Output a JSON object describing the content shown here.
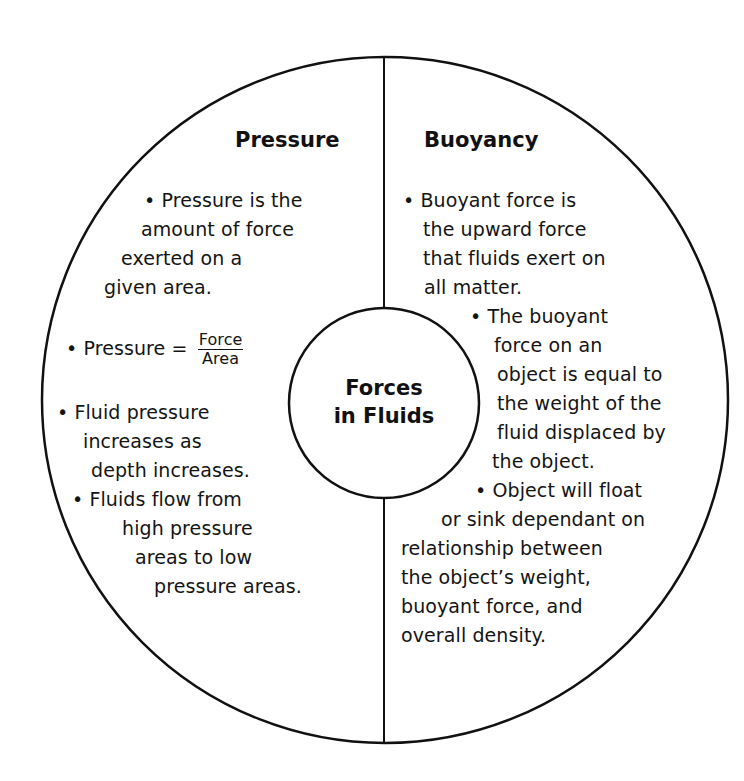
{
  "diagram": {
    "center_title": {
      "line1": "Forces",
      "line2": "in Fluids"
    },
    "left_section": {
      "heading": "Pressure",
      "bullets": [
        {
          "lines": [
            "• Pressure is the",
            "amount of force",
            "exerted on a",
            "given area."
          ]
        },
        {
          "prefix": "• Pressure =",
          "fraction": {
            "numerator": "Force",
            "denominator": "Area"
          }
        },
        {
          "lines": [
            "• Fluid pressure",
            "increases as",
            "depth increases."
          ]
        },
        {
          "lines": [
            "• Fluids flow from",
            "high pressure",
            "areas to low",
            "pressure areas."
          ]
        }
      ]
    },
    "right_section": {
      "heading": "Buoyancy",
      "bullets": [
        {
          "lines": [
            "• Buoyant force is",
            "the upward force",
            "that fluids exert on",
            "all matter."
          ]
        },
        {
          "lines": [
            "• The buoyant",
            "force on an",
            "object is equal to",
            "the weight of the",
            "fluid displaced by",
            "the object."
          ]
        },
        {
          "lines": [
            "• Object will float",
            "or sink dependant on",
            "relationship between",
            "the object’s weight,",
            "buoyant force, and",
            "overall density."
          ]
        }
      ]
    },
    "colors": {
      "background": "#ffffff",
      "stroke": "#111111",
      "text": "#141414"
    }
  }
}
